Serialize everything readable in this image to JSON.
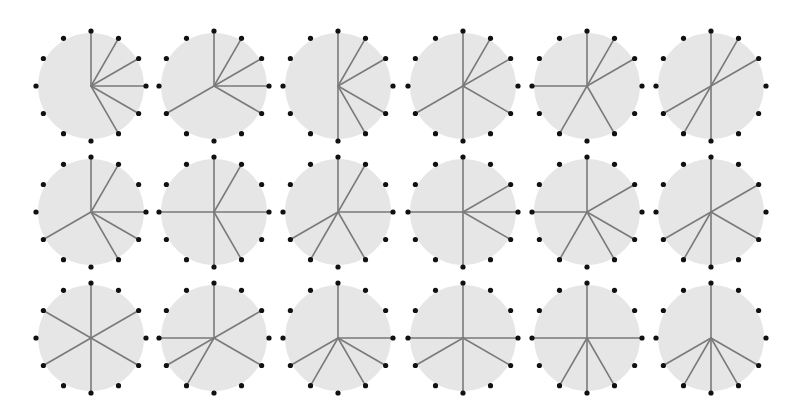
{
  "diagram": {
    "title": "",
    "layout": {
      "rows": 3,
      "cols": 6
    },
    "geometry": {
      "col_centers_x": [
        91,
        214,
        338,
        463,
        587,
        711
      ],
      "row_centers_y": [
        86,
        212,
        338
      ],
      "disk_radius": 53,
      "dot_radius_pos": 55,
      "dot_size": 2.6,
      "positions_per_circle": 12
    },
    "colors": {
      "disk": "#e6e6e6",
      "spoke": "#7a7a7a",
      "dot": "#111111",
      "background": "#ffffff"
    },
    "circles": [
      {
        "row": 0,
        "col": 0,
        "spokes": [
          12,
          1,
          2,
          3,
          4,
          5
        ]
      },
      {
        "row": 0,
        "col": 1,
        "spokes": [
          12,
          1,
          2,
          3,
          4,
          8
        ]
      },
      {
        "row": 0,
        "col": 2,
        "spokes": [
          12,
          1,
          2,
          4,
          5,
          6
        ]
      },
      {
        "row": 0,
        "col": 3,
        "spokes": [
          12,
          1,
          2,
          4,
          6,
          8
        ]
      },
      {
        "row": 0,
        "col": 4,
        "spokes": [
          12,
          1,
          2,
          5,
          7,
          9
        ]
      },
      {
        "row": 0,
        "col": 5,
        "spokes": [
          12,
          1,
          2,
          6,
          7,
          8
        ]
      },
      {
        "row": 1,
        "col": 0,
        "spokes": [
          12,
          1,
          3,
          4,
          5,
          8
        ]
      },
      {
        "row": 1,
        "col": 1,
        "spokes": [
          12,
          1,
          3,
          5,
          6,
          9
        ]
      },
      {
        "row": 1,
        "col": 2,
        "spokes": [
          12,
          1,
          3,
          5,
          7,
          8
        ]
      },
      {
        "row": 1,
        "col": 3,
        "spokes": [
          12,
          2,
          3,
          4,
          6,
          9
        ]
      },
      {
        "row": 1,
        "col": 4,
        "spokes": [
          12,
          2,
          4,
          5,
          7,
          9
        ]
      },
      {
        "row": 1,
        "col": 5,
        "spokes": [
          12,
          2,
          4,
          6,
          7,
          8
        ]
      },
      {
        "row": 2,
        "col": 0,
        "spokes": [
          12,
          2,
          4,
          6,
          8,
          10
        ]
      },
      {
        "row": 2,
        "col": 1,
        "spokes": [
          12,
          2,
          4,
          7,
          8,
          9
        ]
      },
      {
        "row": 2,
        "col": 2,
        "spokes": [
          12,
          3,
          4,
          5,
          7,
          8
        ]
      },
      {
        "row": 2,
        "col": 3,
        "spokes": [
          12,
          3,
          4,
          6,
          8,
          9
        ]
      },
      {
        "row": 2,
        "col": 4,
        "spokes": [
          12,
          3,
          5,
          6,
          7,
          9
        ]
      },
      {
        "row": 2,
        "col": 5,
        "spokes": [
          12,
          4,
          5,
          6,
          7,
          8
        ]
      }
    ]
  }
}
